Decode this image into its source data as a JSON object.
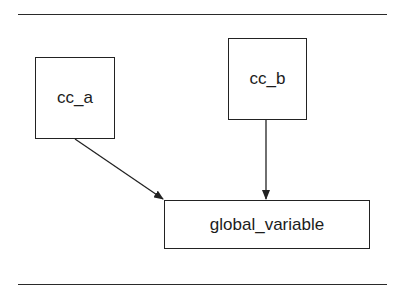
{
  "diagram": {
    "nodes": [
      {
        "id": "cc_a",
        "label": "cc_a"
      },
      {
        "id": "cc_b",
        "label": "cc_b"
      },
      {
        "id": "global_variable",
        "label": "global_variable"
      }
    ],
    "edges": [
      {
        "from": "cc_a",
        "to": "global_variable"
      },
      {
        "from": "cc_b",
        "to": "global_variable"
      }
    ],
    "colors": {
      "stroke": "#222222",
      "background": "#ffffff"
    }
  }
}
